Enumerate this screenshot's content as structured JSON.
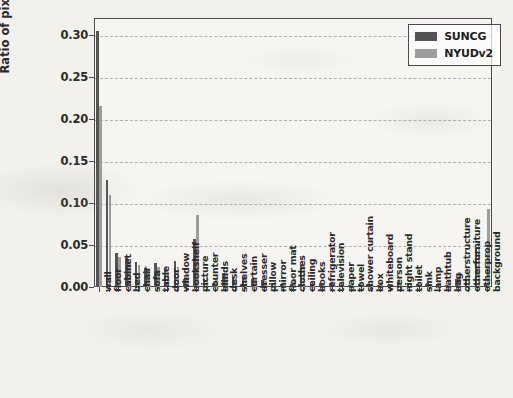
{
  "chart_data": {
    "type": "bar",
    "title": "",
    "xlabel": "",
    "ylabel": "Ratio of pixels",
    "ylim": [
      0.0,
      0.32
    ],
    "yticks": [
      "0.00",
      "0.05",
      "0.10",
      "0.15",
      "0.20",
      "0.25",
      "0.30"
    ],
    "ytick_values": [
      0.0,
      0.05,
      0.1,
      0.15,
      0.2,
      0.25,
      0.3
    ],
    "grid": true,
    "legend_position": "upper right",
    "categories": [
      "wall",
      "floor",
      "cabinet",
      "bed",
      "chair",
      "sofa",
      "table",
      "door",
      "window",
      "bookshelf",
      "picture",
      "counter",
      "blinds",
      "desk",
      "shelves",
      "curtain",
      "dresser",
      "pillow",
      "mirror",
      "floor mat",
      "clothes",
      "ceiling",
      "books",
      "refrigerator",
      "television",
      "paper",
      "towel",
      "shower curtain",
      "box",
      "whiteboard",
      "person",
      "night stand",
      "toilet",
      "sink",
      "lamp",
      "bathtub",
      "bag",
      "otherstructure",
      "otherfurniture",
      "otherprop",
      "background"
    ],
    "series": [
      {
        "name": "SUNCG",
        "color": "#545454",
        "values": [
          0.305,
          0.127,
          0.041,
          0.035,
          0.03,
          0.023,
          0.029,
          0.022,
          0.031,
          0.01,
          0.057,
          0.009,
          0.005,
          0.017,
          0.012,
          0.012,
          0.01,
          0.008,
          0.004,
          0.004,
          0.003,
          0.026,
          0.004,
          0.005,
          0.005,
          0.002,
          0.002,
          0.003,
          0.004,
          0.002,
          0.002,
          0.006,
          0.003,
          0.003,
          0.005,
          0.004,
          0.002,
          0.01,
          0.009,
          0.045,
          0.002
        ]
      },
      {
        "name": "NYUDv2",
        "color": "#9d9d9d",
        "values": [
          0.215,
          0.109,
          0.036,
          0.03,
          0.026,
          0.022,
          0.024,
          0.018,
          0.024,
          0.013,
          0.086,
          0.013,
          0.01,
          0.016,
          0.01,
          0.014,
          0.008,
          0.007,
          0.006,
          0.004,
          0.009,
          0.025,
          0.007,
          0.004,
          0.005,
          0.007,
          0.004,
          0.004,
          0.006,
          0.006,
          0.004,
          0.005,
          0.003,
          0.004,
          0.004,
          0.003,
          0.003,
          0.018,
          0.016,
          0.053,
          0.093
        ]
      }
    ]
  },
  "legend": {
    "entries": [
      {
        "label": "SUNCG",
        "color": "#545454"
      },
      {
        "label": "NYUDv2",
        "color": "#9d9d9d"
      }
    ]
  },
  "axes": {
    "y_axis_label": "Ratio of pixels"
  }
}
